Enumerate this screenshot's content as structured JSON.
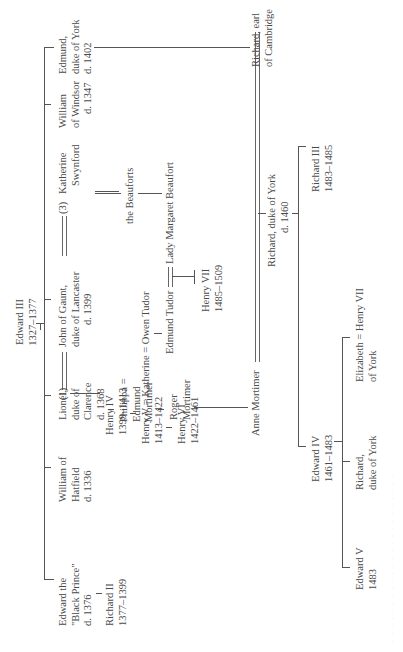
{
  "diagram": {
    "type": "family-tree",
    "orientation": "rotated-90-ccw",
    "root": {
      "name": "Edward III",
      "dates": "1327–1377"
    },
    "children_of_edward_iii": [
      {
        "lines": [
          "Edward the",
          "\"Black Prince\"",
          "d. 1376"
        ],
        "child": {
          "lines": [
            "Richard II",
            "1377–1399"
          ]
        }
      },
      {
        "lines": [
          "William of",
          "Hatfield",
          "d. 1336"
        ]
      },
      {
        "lines": [
          "Lionel,",
          "duke of",
          "Clarence",
          "d. 1368"
        ]
      },
      {
        "lines": [
          "John of Gaunt,",
          "duke of Lancaster",
          "d. 1399"
        ]
      },
      {
        "lines": [
          "William",
          "of Windsor",
          "d. 1347"
        ]
      },
      {
        "lines": [
          "Edmund,",
          "duke of York",
          "d. 1402"
        ]
      }
    ],
    "clarence_line": {
      "philippa": [
        "Philippa =",
        "Edmund",
        "Mortimer"
      ],
      "roger": [
        "Roger",
        "Mortimer"
      ],
      "anne": "Anne Mortimer"
    },
    "lancaster_line": {
      "wife1_marker": "(1)",
      "wife3_marker": "(3)",
      "wife3": [
        "Katherine",
        "Swynford"
      ],
      "henry_iv": [
        "Henry IV",
        "1399–1413"
      ],
      "henry_v": [
        "Henry V = Katherine = Owen Tudor",
        "1413–1422"
      ],
      "henry_vi": [
        "Henry VI",
        "1422–1461"
      ],
      "beauforts": "the Beauforts",
      "edmund_tudor": "Edmund Tudor",
      "margaret": "Lady Margaret Beaufort",
      "henry_vii": [
        "Henry VII",
        "1485–1509"
      ]
    },
    "york_line": {
      "richard_cambridge": [
        "Richard, earl",
        "of Cambridge"
      ],
      "richard_york": [
        "Richard, duke of York",
        "d. 1460"
      ],
      "edward_iv": [
        "Edward IV",
        "1461–1483"
      ],
      "richard_iii": [
        "Richard III",
        "1483–1485"
      ],
      "edward_v": [
        "Edward V",
        "1483"
      ],
      "richard_duke_york": [
        "Richard,",
        "duke of York"
      ],
      "elizabeth": [
        "Elizabeth = Henry VII",
        "of York"
      ]
    }
  },
  "colors": {
    "text": "#4a4a4a",
    "lines": "#555555",
    "background": "#ffffff"
  }
}
